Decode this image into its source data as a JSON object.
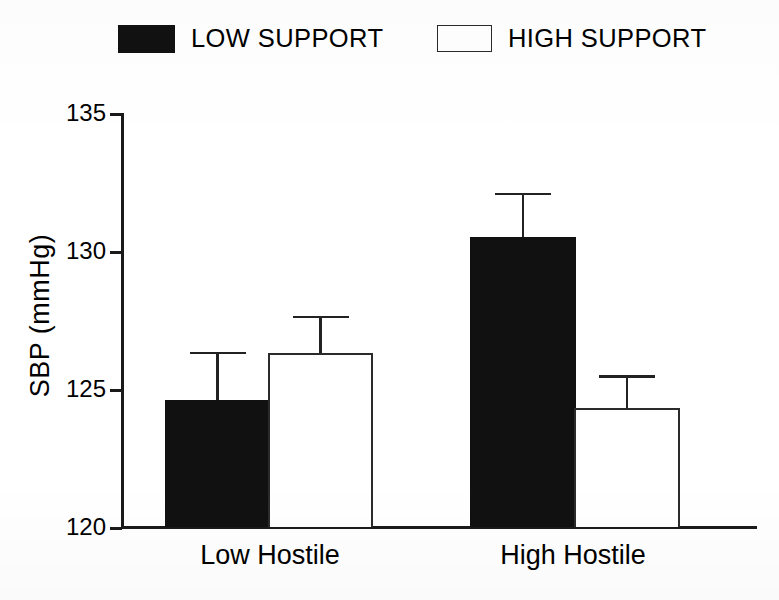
{
  "chart_data": {
    "type": "bar",
    "title": "",
    "xlabel": "",
    "ylabel": "SBP (mmHg)",
    "ylim": [
      120,
      135
    ],
    "yticks": [
      120,
      125,
      130,
      135
    ],
    "ytick_labels": [
      "120",
      "125",
      "130",
      "135"
    ],
    "grid": false,
    "legend_position": "top",
    "categories": [
      "Low Hostile",
      "High Hostile"
    ],
    "series": [
      {
        "name": "LOW SUPPORT",
        "style": "filled-black",
        "color": "#111111",
        "values": [
          124.6,
          130.5
        ],
        "errors_upper": [
          126.35,
          132.1
        ]
      },
      {
        "name": "HIGH SUPPORT",
        "style": "hollow-white",
        "color": "#ffffff",
        "edge_color": "#2b2b2b",
        "values": [
          126.3,
          124.3
        ],
        "errors_upper": [
          127.65,
          125.5
        ]
      }
    ]
  },
  "legend": {
    "items": [
      {
        "label": "LOW SUPPORT",
        "swatch": "filled-square-icon"
      },
      {
        "label": "HIGH SUPPORT",
        "swatch": "hollow-square-icon"
      }
    ]
  },
  "axes": {
    "y_title": "SBP (mmHg)",
    "y_tick_labels": [
      "135",
      "130",
      "125",
      "120"
    ],
    "x_tick_labels": [
      "Low Hostile",
      "High Hostile"
    ]
  }
}
